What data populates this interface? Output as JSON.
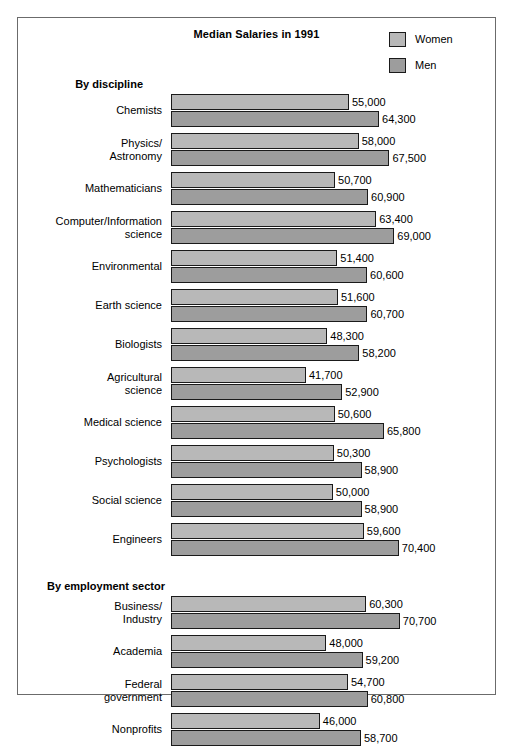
{
  "chart_data": {
    "type": "bar",
    "title": "Median Salaries in 1991",
    "orientation": "horizontal",
    "grouped": true,
    "xlabel": "",
    "ylabel": "",
    "xlim": [
      0,
      72000
    ],
    "grid": false,
    "legend_position": "top-right",
    "value_format": "comma-separated",
    "series": [
      {
        "name": "Women",
        "color": "#b8b8b8"
      },
      {
        "name": "Men",
        "color": "#9d9d9d"
      }
    ],
    "sections": [
      {
        "heading": "By discipline",
        "categories": [
          "Chemists",
          "Physics/\nAstronomy",
          "Mathematicians",
          "Computer/Information\nscience",
          "Environmental",
          "Earth science",
          "Biologists",
          "Agricultural\nscience",
          "Medical science",
          "Psychologists",
          "Social science",
          "Engineers"
        ],
        "women": [
          55000,
          58000,
          50700,
          63400,
          51400,
          51600,
          48300,
          41700,
          50600,
          50300,
          50000,
          59600
        ],
        "men": [
          64300,
          67500,
          60900,
          69000,
          60600,
          60700,
          58200,
          52900,
          65800,
          58900,
          58900,
          70400
        ]
      },
      {
        "heading": "By employment sector",
        "categories": [
          "Business/\nIndustry",
          "Academia",
          "Federal\ngovernment",
          "Nonprofits"
        ],
        "women": [
          60300,
          48000,
          54700,
          46000
        ],
        "men": [
          70700,
          59200,
          60800,
          58700
        ]
      }
    ]
  },
  "chart": {
    "title": "Median Salaries in 1991"
  },
  "legend": {
    "items": [
      {
        "label": "Women",
        "color": "#b8b8b8"
      },
      {
        "label": "Men",
        "color": "#9d9d9d"
      }
    ]
  }
}
